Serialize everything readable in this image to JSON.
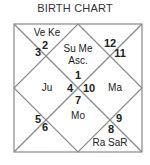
{
  "title": "BIRTH CHART",
  "chart_type": "North Indian diamond birth chart",
  "houses": [
    {
      "position": "top-center",
      "sign": "1",
      "planets": "Su Me",
      "extra": "Asc."
    },
    {
      "position": "top-left",
      "sign": "2",
      "planets": "Ve Ke"
    },
    {
      "position": "left-top",
      "sign": "3",
      "planets": ""
    },
    {
      "position": "left-center",
      "sign": "4",
      "planets": "Ju"
    },
    {
      "position": "left-bottom",
      "sign": "5",
      "planets": ""
    },
    {
      "position": "bottom-left",
      "sign": "6",
      "planets": ""
    },
    {
      "position": "bottom-center",
      "sign": "7",
      "planets": "Mo"
    },
    {
      "position": "bottom-right",
      "sign": "8",
      "planets": "Ra SaR"
    },
    {
      "position": "right-bottom",
      "sign": "9",
      "planets": ""
    },
    {
      "position": "right-center",
      "sign": "10",
      "planets": "Ma"
    },
    {
      "position": "right-top",
      "sign": "11",
      "planets": ""
    },
    {
      "position": "top-right",
      "sign": "12",
      "planets": ""
    }
  ],
  "colors": {
    "line": "#8a8a8a",
    "text": "#222222",
    "background": "#ffffff"
  }
}
